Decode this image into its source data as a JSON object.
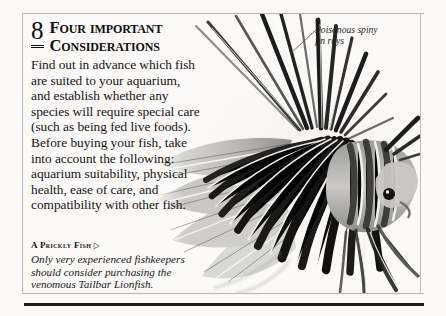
{
  "page": {
    "background_color": "#fbfaf8",
    "rule_color": "#b9b6b1",
    "bottom_rule_color": "#1d1d1d",
    "clipped_top_text_a": "g",
    "clipped_top_text_b": "pp"
  },
  "section": {
    "number": "8",
    "heading_line_1_first": "F",
    "heading_line_1_rest": "our important",
    "heading_line_2_first": "C",
    "heading_line_2_rest": "onsiderations",
    "body": "Find out in advance which fish are suited to your aquarium, and establish whether any species will require special care (such as being fed live foods). Before buying your fish, take into account the following: aquarium suitability, physical health, ease of care, and compatibility with other fish."
  },
  "caption": {
    "title_first": "A P",
    "title_rest": "rickly",
    "title_second_first": "F",
    "title_second_rest": "ish",
    "title_arrow": "▷",
    "body": "Only very experienced fishkeepers should consider purchasing the venomous Tailbar Lionfish."
  },
  "annotation": {
    "label": "Poisonous spiny fin rays",
    "leader_line_color": "#4a4a4a"
  },
  "photo": {
    "subject": "Tailbar Lionfish",
    "style": "black-and-white photograph",
    "alt": "A lionfish with long venomous spiny fin rays, shown in monochrome"
  }
}
